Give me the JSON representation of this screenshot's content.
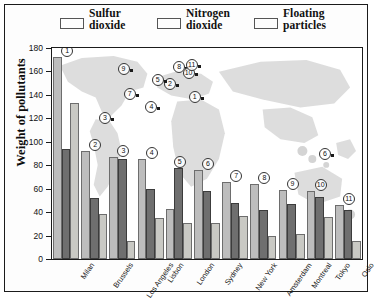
{
  "legend": {
    "items": [
      {
        "name": "sulfur-dioxide",
        "line1": "Sulfur",
        "line2": "dioxide",
        "color": "#bdbdbd"
      },
      {
        "name": "nitrogen-dioxide",
        "line1": "Nitrogen",
        "line2": "dioxide",
        "color": "#6f6f6f"
      },
      {
        "name": "floating-particles",
        "line1": "Floating",
        "line2": "particles",
        "color": "#c9c9c4"
      }
    ]
  },
  "axis": {
    "ylabel": "Weight of pollutants",
    "yticks": [
      "0",
      "20",
      "40",
      "60",
      "80",
      "100",
      "120",
      "140",
      "160",
      "180"
    ]
  },
  "map_markers": [
    {
      "num": "1",
      "x": 48,
      "y": 23
    },
    {
      "num": "2",
      "x": 40,
      "y": 17
    },
    {
      "num": "3",
      "x": 19,
      "y": 33
    },
    {
      "num": "4",
      "x": 34,
      "y": 28
    },
    {
      "num": "5",
      "x": 36,
      "y": 15
    },
    {
      "num": "6",
      "x": 90,
      "y": 50
    },
    {
      "num": "7",
      "x": 27,
      "y": 22
    },
    {
      "num": "8",
      "x": 43,
      "y": 9
    },
    {
      "num": "9",
      "x": 25,
      "y": 10
    },
    {
      "num": "10",
      "x": 46,
      "y": 12
    },
    {
      "num": "11",
      "x": 47,
      "y": 8
    }
  ],
  "chart_data": {
    "type": "bar",
    "title": "",
    "xlabel": "",
    "ylabel": "Weight of pollutants",
    "ylim": [
      0,
      180
    ],
    "ytick_step": 20,
    "grid": false,
    "legend_position": "top",
    "categories": [
      "Milan",
      "Brussels",
      "Los Angeles",
      "Lisbon",
      "London",
      "Sydney",
      "New York",
      "Amsterdam",
      "Montreal",
      "Tokyo",
      "Oslo"
    ],
    "group_numbers": [
      "1",
      "2",
      "3",
      "4",
      "5",
      "6",
      "7",
      "8",
      "9",
      "10",
      "11"
    ],
    "series": [
      {
        "name": "Sulfur dioxide",
        "color": "#bdbdbd",
        "values": [
          172,
          92,
          87,
          85,
          43,
          76,
          66,
          64,
          59,
          58,
          46
        ]
      },
      {
        "name": "Nitrogen dioxide",
        "color": "#6f6f6f",
        "values": [
          94,
          52,
          85,
          60,
          78,
          58,
          48,
          42,
          47,
          53,
          42
        ]
      },
      {
        "name": "Floating particles",
        "color": "#c9c9c4",
        "values": [
          133,
          38,
          15,
          35,
          31,
          31,
          37,
          20,
          21,
          36,
          15
        ]
      }
    ]
  }
}
